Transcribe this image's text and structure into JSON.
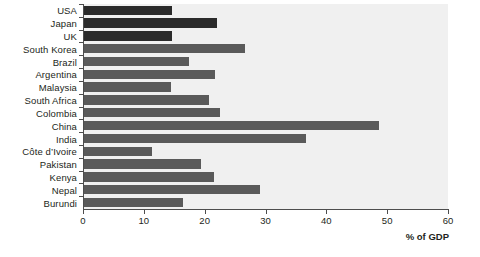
{
  "chart_data": {
    "type": "bar",
    "orientation": "horizontal",
    "title": "",
    "subtitle": "",
    "xlabel": "% of GDP",
    "ylabel": "",
    "xlim": [
      0,
      60
    ],
    "xticks": [
      0,
      10,
      20,
      30,
      40,
      50,
      60
    ],
    "grid": false,
    "legend": false,
    "categories": [
      "USA",
      "Japan",
      "UK",
      "South Korea",
      "Brazil",
      "Argentina",
      "Malaysia",
      "South Africa",
      "Colombia",
      "China",
      "India",
      "Côte d’Ivoire",
      "Pakistan",
      "Kenya",
      "Nepal",
      "Burundi"
    ],
    "values": [
      14.5,
      21.8,
      14.5,
      26.5,
      17.3,
      21.5,
      14.3,
      20.5,
      22.3,
      48.5,
      36.5,
      11.2,
      19.3,
      21.3,
      29.0,
      16.2
    ],
    "bar_colors": [
      "#2b2b2b",
      "#2b2b2b",
      "#2b2b2b",
      "#5a5a5a",
      "#5a5a5a",
      "#5a5a5a",
      "#5a5a5a",
      "#5a5a5a",
      "#5a5a5a",
      "#5a5a5a",
      "#5a5a5a",
      "#5a5a5a",
      "#5a5a5a",
      "#5a5a5a",
      "#5a5a5a",
      "#5a5a5a"
    ]
  },
  "colors": {
    "plot_background": "#f0f0f0",
    "page_background": "#ffffff",
    "axis": "#4d4d4d",
    "text": "#231f20",
    "bar_dark": "#2b2b2b",
    "bar_gray": "#5a5a5a"
  },
  "axis_title": "% of GDP"
}
